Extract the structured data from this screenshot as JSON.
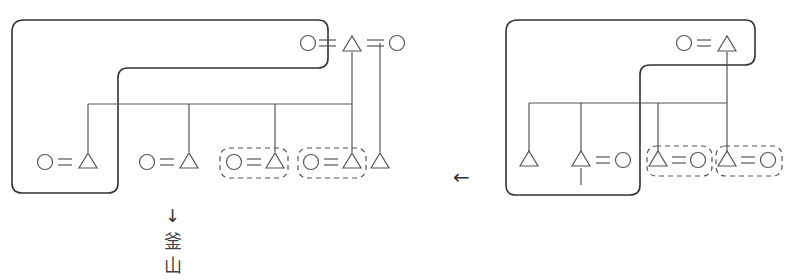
{
  "diagram": {
    "type": "kinship-diagram",
    "symbols": {
      "circle": "female",
      "triangle": "male",
      "double_line": "marriage",
      "vertical_line": "descent",
      "horizontal_line": "sibling-link"
    },
    "direction_arrow": "←",
    "left_panel": {
      "top_row": [
        "○",
        "=",
        "△",
        "=",
        "○"
      ],
      "children": [
        {
          "pair": [
            "○",
            "=",
            "△"
          ],
          "in_enclosure": true
        },
        {
          "pair": [
            "○",
            "=",
            "△"
          ],
          "in_enclosure": false
        },
        {
          "pair": [
            "○",
            "=",
            "△"
          ],
          "dashed_box": true
        },
        {
          "pair": [
            "○",
            "=",
            "△"
          ],
          "dashed_box": true
        },
        {
          "pair": [
            "△"
          ],
          "dashed_box": false
        }
      ],
      "out_arrow": "↓",
      "out_label_line1": "釜",
      "out_label_line2": "山"
    },
    "right_panel": {
      "top_row": [
        "○",
        "=",
        "△"
      ],
      "children": [
        {
          "pair": [
            "△"
          ],
          "in_enclosure": true
        },
        {
          "pair": [
            "△",
            "=",
            "○"
          ],
          "in_enclosure": true,
          "incoming_arrow": true
        },
        {
          "pair": [
            "△",
            "=",
            "○"
          ],
          "dashed_box": true
        },
        {
          "pair": [
            "△",
            "=",
            "○"
          ],
          "dashed_box": true
        }
      ]
    },
    "colors": {
      "line": "#555555",
      "enclosure": "#333333",
      "symbol": "#666666"
    }
  }
}
